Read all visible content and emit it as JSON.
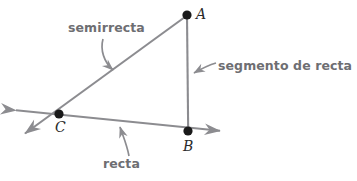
{
  "diagram": {
    "colors": {
      "line": "#8c8c90",
      "point": "#1a1a1a",
      "callout_text": "#6e6e72",
      "callout_arrow": "#8c8c90",
      "point_label": "#2b2b2b",
      "background": "#ffffff"
    },
    "points": [
      {
        "id": "A",
        "label": "A",
        "x": 187,
        "y": 15,
        "label_x": 196,
        "label_y": 6
      },
      {
        "id": "B",
        "label": "B",
        "x": 188,
        "y": 131,
        "label_x": 183,
        "label_y": 138
      },
      {
        "id": "C",
        "label": "C",
        "x": 59,
        "y": 114,
        "label_x": 55,
        "label_y": 119
      }
    ],
    "callouts": [
      {
        "id": "semirrecta",
        "label": "semirrecta",
        "points_to": "ray-CA",
        "text_x": 68,
        "text_y": 20,
        "arrow_from": [
          105,
          39
        ],
        "arrow_to": [
          115,
          72
        ]
      },
      {
        "id": "segmento-de-recta",
        "label": "segmento de recta",
        "points_to": "segment-AB",
        "text_x": 218,
        "text_y": 58,
        "arrow_from": [
          216,
          63
        ],
        "arrow_to": [
          191,
          74
        ]
      },
      {
        "id": "recta",
        "label": "recta",
        "points_to": "line-CB",
        "text_x": 103,
        "text_y": 156,
        "arrow_from": [
          129,
          157
        ],
        "arrow_to": [
          120,
          124
        ]
      }
    ],
    "figures": [
      {
        "id": "segment-AB",
        "kind": "segment",
        "name": "segmento de recta",
        "from": [
          187,
          15
        ],
        "to": [
          188,
          131
        ],
        "arrow_start": false,
        "arrow_end": false
      },
      {
        "id": "ray-CA",
        "kind": "ray",
        "name": "semirrecta",
        "from": [
          187,
          15
        ],
        "to": [
          22,
          136
        ],
        "arrow_start": false,
        "arrow_end": true
      },
      {
        "id": "line-CB",
        "kind": "line",
        "name": "recta",
        "from": [
          14,
          110
        ],
        "to": [
          222,
          131
        ],
        "arrow_start": true,
        "arrow_end": true
      }
    ]
  }
}
